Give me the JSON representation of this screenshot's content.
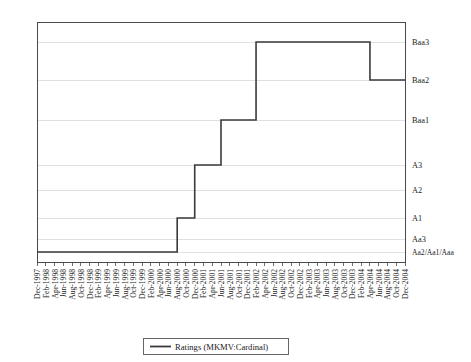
{
  "chart_data": {
    "type": "line",
    "title": "",
    "xlabel": "",
    "ylabel": "",
    "grid": true,
    "legend_position": "bottom-center",
    "legend": [
      "Ratings (MKMV:Cardinal)"
    ],
    "y_categories": [
      "Aa2/Aa1/Aaa",
      "Aa3",
      "A1",
      "A2",
      "A3",
      "Baa1",
      "Baa2",
      "Baa3"
    ],
    "ytick_labels": [
      "Baa3",
      "Baa2",
      "Baa1",
      "A3",
      "A2",
      "A1",
      "Aa3",
      "Aa2/Aa1/Aaa"
    ],
    "ylim": [
      0,
      8
    ],
    "categories": [
      "Dec-1997",
      "Feb-1998",
      "Apr-1998",
      "Jun-1998",
      "Aug-1998",
      "Oct-1998",
      "Dec-1998",
      "Feb-1999",
      "Apr-1999",
      "Jun-1999",
      "Aug-1999",
      "Oct-1999",
      "Dec-1999",
      "Feb-2000",
      "Apr-2000",
      "Jun-2000",
      "Aug-2000",
      "Oct-2000",
      "Dec-2000",
      "Feb-2001",
      "Apr-2001",
      "Jun-2001",
      "Aug-2001",
      "Oct-2001",
      "Dec-2001",
      "Feb-2002",
      "Apr-2002",
      "Jun-2002",
      "Aug-2002",
      "Oct-2002",
      "Dec-2002",
      "Feb-2003",
      "Apr-2003",
      "Jun-2003",
      "Aug-2003",
      "Oct-2003",
      "Dec-2003",
      "Feb-2004",
      "Apr-2004",
      "Jun-2004",
      "Aug-2004",
      "Oct-2004",
      "Dec-2004"
    ],
    "series": [
      {
        "name": "Ratings (MKMV:Cardinal)",
        "color": "#3a3a3a",
        "values": [
          0,
          0,
          0,
          0,
          0,
          0,
          0,
          0,
          0,
          0,
          0,
          0,
          0,
          0,
          0,
          0,
          2,
          2,
          4,
          4,
          4,
          5,
          5,
          5,
          5,
          7,
          7,
          7,
          7,
          7,
          7,
          7,
          7,
          7,
          7,
          7,
          7,
          7,
          6,
          6,
          6,
          6,
          6
        ]
      }
    ]
  }
}
